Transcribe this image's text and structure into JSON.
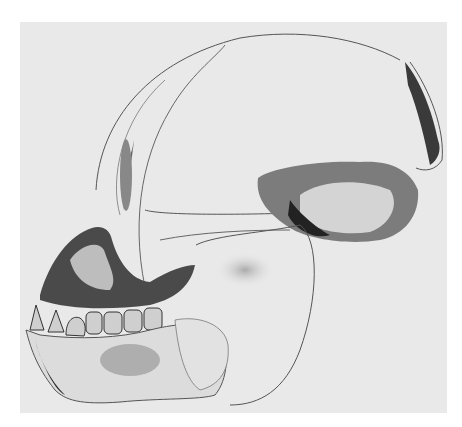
{
  "figure": {
    "background_color": "#ffffff",
    "plate_color": "#e9e9e9",
    "ink_color": "#3a3a3a",
    "shadow_color": "#1e1e1e"
  }
}
